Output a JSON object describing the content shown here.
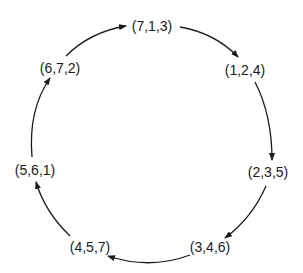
{
  "diagram": {
    "type": "cycle",
    "direction": "clockwise",
    "nodes": [
      {
        "id": "n0",
        "label": "(7,1,3)",
        "x": 152,
        "y": 31
      },
      {
        "id": "n1",
        "label": "(1,2,4)",
        "x": 245,
        "y": 75
      },
      {
        "id": "n2",
        "label": "(2,3,5)",
        "x": 268,
        "y": 177
      },
      {
        "id": "n3",
        "label": "(3,4,6)",
        "x": 210,
        "y": 252
      },
      {
        "id": "n4",
        "label": "(4,5,7)",
        "x": 90,
        "y": 252
      },
      {
        "id": "n5",
        "label": "(5,6,1)",
        "x": 35,
        "y": 175
      },
      {
        "id": "n6",
        "label": "(6,7,2)",
        "x": 60,
        "y": 73
      }
    ],
    "edges": [
      {
        "from": "(7,1,3)",
        "to": "(1,2,4)"
      },
      {
        "from": "(1,2,4)",
        "to": "(2,3,5)"
      },
      {
        "from": "(2,3,5)",
        "to": "(3,4,6)"
      },
      {
        "from": "(3,4,6)",
        "to": "(4,5,7)"
      },
      {
        "from": "(4,5,7)",
        "to": "(5,6,1)"
      },
      {
        "from": "(5,6,1)",
        "to": "(6,7,2)"
      },
      {
        "from": "(6,7,2)",
        "to": "(7,1,3)"
      }
    ],
    "colors": {
      "ink": "#1a1a1a",
      "background": "#ffffff"
    }
  }
}
